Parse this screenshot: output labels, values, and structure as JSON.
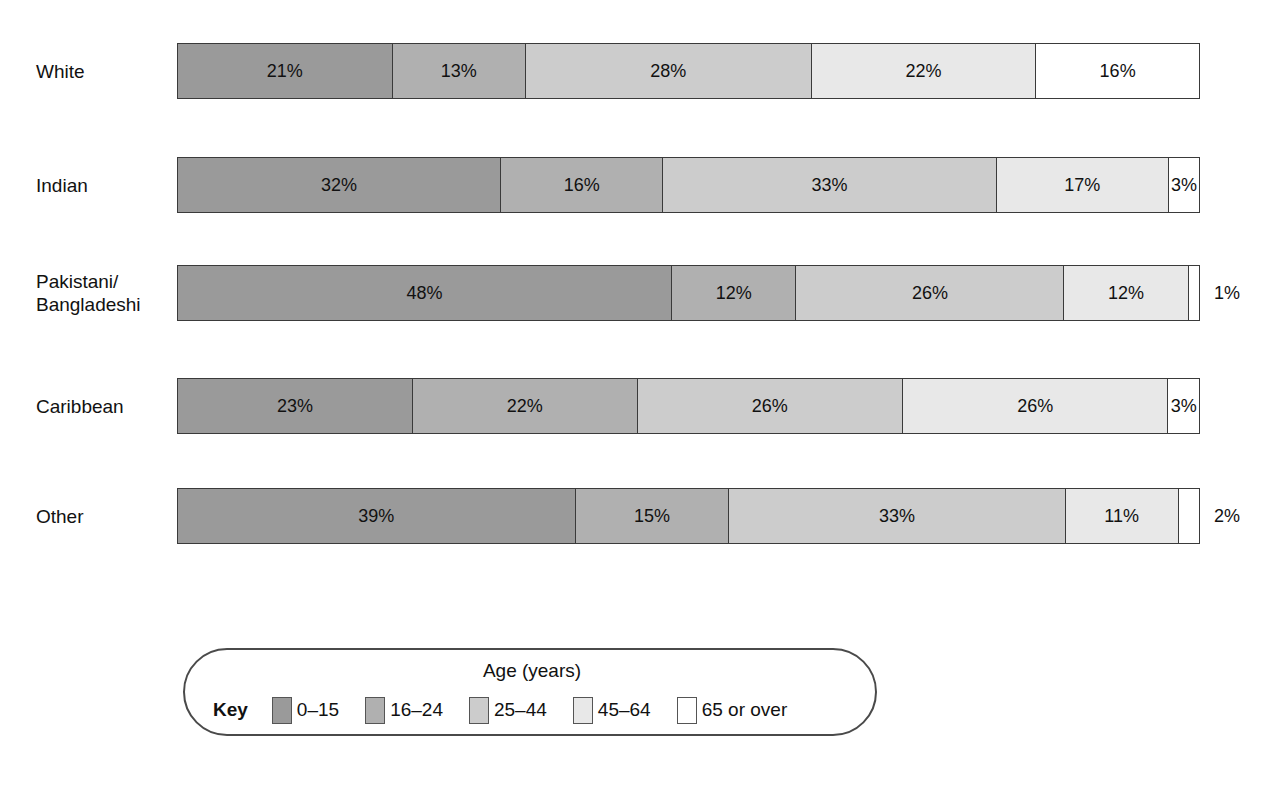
{
  "chart_data": {
    "type": "bar",
    "subtype": "100% stacked horizontal bar",
    "title": "",
    "xlabel": "",
    "ylabel": "",
    "xlim": [
      0,
      100
    ],
    "grid": false,
    "legend_position": "bottom",
    "legend_title": "Age (years)",
    "categories": [
      "White",
      "Indian",
      "Pakistani/\nBangladeshi",
      "Caribbean",
      "Other"
    ],
    "series": [
      {
        "name": "0–15",
        "values": [
          21,
          32,
          48,
          23,
          39
        ]
      },
      {
        "name": "16–24",
        "values": [
          13,
          16,
          12,
          22,
          15
        ]
      },
      {
        "name": "25–44",
        "values": [
          28,
          33,
          26,
          26,
          33
        ]
      },
      {
        "name": "45–64",
        "values": [
          22,
          17,
          12,
          26,
          11
        ]
      },
      {
        "name": "65 or over",
        "values": [
          16,
          3,
          1,
          3,
          2
        ]
      }
    ],
    "value_labels": [
      [
        "21%",
        "13%",
        "28%",
        "22%",
        "16%"
      ],
      [
        "32%",
        "16%",
        "33%",
        "17%",
        "3%"
      ],
      [
        "48%",
        "12%",
        "26%",
        "12%",
        "1%"
      ],
      [
        "23%",
        "22%",
        "26%",
        "26%",
        "3%"
      ],
      [
        "39%",
        "15%",
        "33%",
        "11%",
        "2%"
      ]
    ],
    "label_placement": [
      [
        "inside",
        "inside",
        "inside",
        "inside",
        "inside"
      ],
      [
        "inside",
        "inside",
        "inside",
        "inside",
        "inside"
      ],
      [
        "inside",
        "inside",
        "inside",
        "inside",
        "outside"
      ],
      [
        "inside",
        "inside",
        "inside",
        "inside",
        "inside"
      ],
      [
        "inside",
        "inside",
        "inside",
        "inside",
        "outside"
      ]
    ],
    "series_colors": [
      "#9a9a9a",
      "#b0b0b0",
      "#cccccc",
      "#e8e8e8",
      "#ffffff"
    ]
  },
  "rows": [
    {
      "label": "White",
      "segments": [
        {
          "label": "21%",
          "value": 21,
          "color": "#9a9a9a",
          "placement": "inside"
        },
        {
          "label": "13%",
          "value": 13,
          "color": "#b0b0b0",
          "placement": "inside"
        },
        {
          "label": "28%",
          "value": 28,
          "color": "#cccccc",
          "placement": "inside"
        },
        {
          "label": "22%",
          "value": 22,
          "color": "#e8e8e8",
          "placement": "inside"
        },
        {
          "label": "16%",
          "value": 16,
          "color": "#ffffff",
          "placement": "inside"
        }
      ],
      "outside_label": ""
    },
    {
      "label": "Indian",
      "segments": [
        {
          "label": "32%",
          "value": 32,
          "color": "#9a9a9a",
          "placement": "inside"
        },
        {
          "label": "16%",
          "value": 16,
          "color": "#b0b0b0",
          "placement": "inside"
        },
        {
          "label": "33%",
          "value": 33,
          "color": "#cccccc",
          "placement": "inside"
        },
        {
          "label": "17%",
          "value": 17,
          "color": "#e8e8e8",
          "placement": "inside"
        },
        {
          "label": "3%",
          "value": 3,
          "color": "#ffffff",
          "placement": "inside"
        }
      ],
      "outside_label": ""
    },
    {
      "label": "Pakistani/\nBangladeshi",
      "segments": [
        {
          "label": "48%",
          "value": 48,
          "color": "#9a9a9a",
          "placement": "inside"
        },
        {
          "label": "12%",
          "value": 12,
          "color": "#b0b0b0",
          "placement": "inside"
        },
        {
          "label": "26%",
          "value": 26,
          "color": "#cccccc",
          "placement": "inside"
        },
        {
          "label": "12%",
          "value": 12,
          "color": "#e8e8e8",
          "placement": "inside"
        },
        {
          "label": "",
          "value": 1,
          "color": "#ffffff",
          "placement": "outside"
        }
      ],
      "outside_label": "1%"
    },
    {
      "label": "Caribbean",
      "segments": [
        {
          "label": "23%",
          "value": 23,
          "color": "#9a9a9a",
          "placement": "inside"
        },
        {
          "label": "22%",
          "value": 22,
          "color": "#b0b0b0",
          "placement": "inside"
        },
        {
          "label": "26%",
          "value": 26,
          "color": "#cccccc",
          "placement": "inside"
        },
        {
          "label": "26%",
          "value": 26,
          "color": "#e8e8e8",
          "placement": "inside"
        },
        {
          "label": "3%",
          "value": 3,
          "color": "#ffffff",
          "placement": "inside"
        }
      ],
      "outside_label": ""
    },
    {
      "label": "Other",
      "segments": [
        {
          "label": "39%",
          "value": 39,
          "color": "#9a9a9a",
          "placement": "inside"
        },
        {
          "label": "15%",
          "value": 15,
          "color": "#b0b0b0",
          "placement": "inside"
        },
        {
          "label": "33%",
          "value": 33,
          "color": "#cccccc",
          "placement": "inside"
        },
        {
          "label": "11%",
          "value": 11,
          "color": "#e8e8e8",
          "placement": "inside"
        },
        {
          "label": "",
          "value": 2,
          "color": "#ffffff",
          "placement": "outside"
        }
      ],
      "outside_label": "2%"
    }
  ],
  "legend": {
    "title": "Age (years)",
    "key_word": "Key",
    "items": [
      {
        "label": "0–15",
        "color": "#9a9a9a"
      },
      {
        "label": "16–24",
        "color": "#b0b0b0"
      },
      {
        "label": "25–44",
        "color": "#cccccc"
      },
      {
        "label": "45–64",
        "color": "#e8e8e8"
      },
      {
        "label": "65 or over",
        "color": "#ffffff"
      }
    ]
  },
  "layout": {
    "row_tops": [
      43,
      157,
      265,
      378,
      488
    ],
    "bar_left": 177,
    "bar_width": 1023,
    "bar_height": 56
  }
}
